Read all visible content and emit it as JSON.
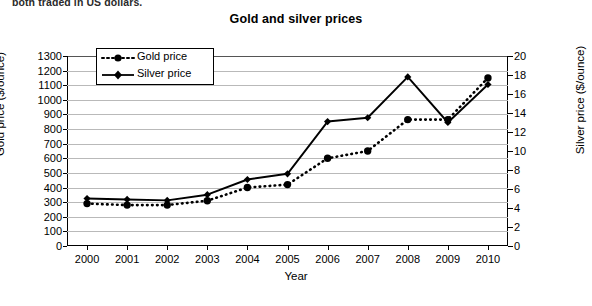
{
  "caption": "both traded in US dollars.",
  "chart_data": {
    "type": "line",
    "title": "Gold and silver prices",
    "xlabel": "Year",
    "ylabel": "Gold price ($/ounce)",
    "ylabel_right": "Silver price ($/ounce)",
    "categories": [
      "2000",
      "2001",
      "2002",
      "2003",
      "2004",
      "2005",
      "2006",
      "2007",
      "2008",
      "2009",
      "2010"
    ],
    "x": [
      2000,
      2001,
      2002,
      2003,
      2004,
      2005,
      2006,
      2007,
      2008,
      2009,
      2010
    ],
    "ylim": [
      0,
      1300
    ],
    "ylim_right": [
      0,
      20
    ],
    "yticks": [
      "0",
      "100",
      "200",
      "300",
      "400",
      "500",
      "600",
      "700",
      "800",
      "900",
      "1000",
      "1100",
      "1200",
      "1300"
    ],
    "yticks_right": [
      "0",
      "2",
      "4",
      "6",
      "8",
      "10",
      "12",
      "14",
      "16",
      "18",
      "20"
    ],
    "grid": true,
    "legend_position": "upper-left-inside",
    "series": [
      {
        "name": "Gold price",
        "axis": "left",
        "unit": "$/ounce",
        "marker": "circle",
        "line_style": "dotted",
        "color": "#000000",
        "values": [
          290,
          280,
          280,
          310,
          400,
          420,
          600,
          650,
          865,
          865,
          1150
        ]
      },
      {
        "name": "Silver price",
        "axis": "right",
        "unit": "$/ounce",
        "marker": "diamond",
        "line_style": "solid",
        "color": "#000000",
        "values": [
          5.0,
          4.9,
          4.8,
          5.4,
          7.0,
          7.6,
          13.1,
          13.5,
          17.8,
          13.0,
          17.0
        ]
      }
    ]
  }
}
